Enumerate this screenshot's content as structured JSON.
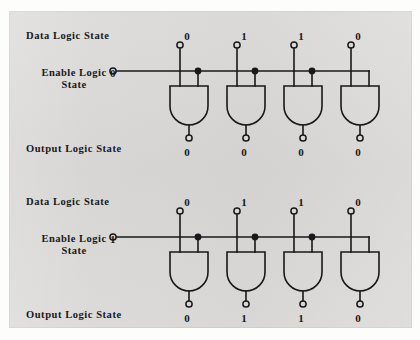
{
  "figure": {
    "type": "logic-diagram",
    "background_color": "#d9d8d6",
    "ink_color": "#19181a"
  },
  "labels": {
    "data_logic_state": "Data Logic State",
    "enable_logic_line1": "Enable Logic",
    "enable_logic_line2": "State",
    "output_logic_state": "Output Logic State"
  },
  "blocks": [
    {
      "name": "enable-low",
      "enable_value": "0",
      "data_values": [
        "0",
        "1",
        "1",
        "0"
      ],
      "output_values": [
        "0",
        "0",
        "0",
        "0"
      ],
      "gate_count": 4,
      "gate_type": "AND"
    },
    {
      "name": "enable-high",
      "enable_value": "1",
      "data_values": [
        "0",
        "1",
        "1",
        "0"
      ],
      "output_values": [
        "0",
        "1",
        "1",
        "0"
      ],
      "gate_count": 4,
      "gate_type": "AND"
    }
  ]
}
